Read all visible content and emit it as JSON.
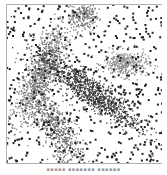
{
  "figure": {
    "caption": "▪▪▪▪▪ ▪▪▪▪▪▪▪ ▪▪▪▪▪▪"
  },
  "chart_data": {
    "type": "scatter",
    "title": "",
    "xlabel": "",
    "ylabel": "",
    "xlim": [
      0,
      1
    ],
    "ylim": [
      0,
      1
    ],
    "grid": false,
    "legend": null,
    "frame": {
      "left": true,
      "top": true,
      "bottom": true,
      "right": false,
      "color": "#b0b0b0"
    },
    "noise": {
      "color": "#202020",
      "count": 520,
      "marker_size": 2
    },
    "clusters": [
      {
        "name": "top-center",
        "color": "#7a7a7a",
        "center": [
          0.5,
          0.93
        ],
        "sx": 0.045,
        "sy": 0.05,
        "angle": 0,
        "count": 220
      },
      {
        "name": "upper-left-diagonal",
        "color": "#7a7a7a",
        "center": [
          0.22,
          0.56
        ],
        "sx": 0.05,
        "sy": 0.17,
        "angle": -25,
        "count": 900
      },
      {
        "name": "right-blob",
        "color": "#8c8c8c",
        "center": [
          0.76,
          0.63
        ],
        "sx": 0.07,
        "sy": 0.04,
        "angle": 0,
        "count": 350
      },
      {
        "name": "center-diagonal",
        "color": "#3c3c3c",
        "center": [
          0.53,
          0.46
        ],
        "sx": 0.2,
        "sy": 0.045,
        "angle": -35,
        "count": 1000
      },
      {
        "name": "lower-left-diagonal",
        "color": "#6e6e6e",
        "center": [
          0.32,
          0.22
        ],
        "sx": 0.05,
        "sy": 0.15,
        "angle": 30,
        "count": 600
      }
    ]
  }
}
